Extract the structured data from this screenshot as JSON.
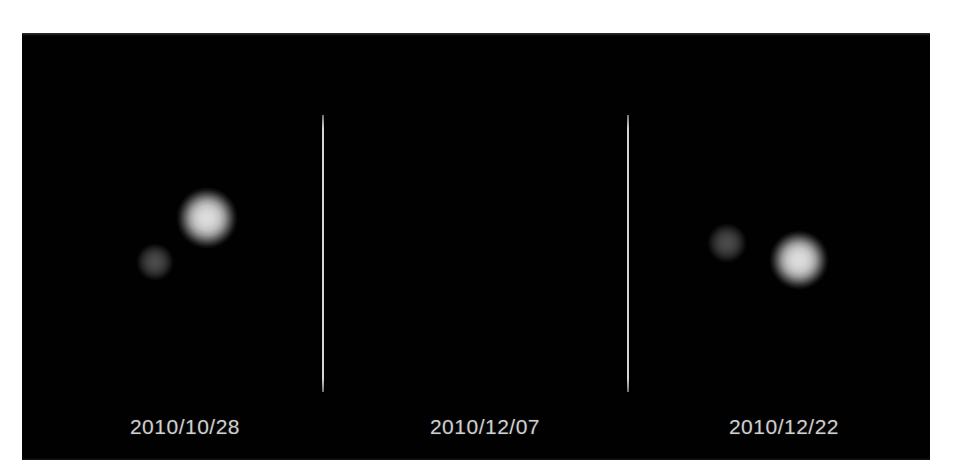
{
  "figure": {
    "background_color": "#ffffff",
    "plate_color": "#010101",
    "caption_color": "#cfcfcf",
    "divider_color": "#e1e1e1"
  },
  "panels": [
    {
      "id": "panel-1",
      "date": "2010/10/28",
      "objects": [
        {
          "name": "charon",
          "label": "dim companion",
          "brightness": "dim",
          "cx": 133,
          "cy": 229,
          "r": 19
        },
        {
          "name": "pluto",
          "label": "bright primary",
          "brightness": "bright",
          "cx": 185,
          "cy": 185,
          "r": 31
        }
      ]
    },
    {
      "id": "panel-2",
      "date": "2010/12/07",
      "objects": [
        {
          "name": "charon",
          "label": "dim companion",
          "brightness": "dim",
          "cx": 403,
          "cy": 210,
          "r": 20
        },
        {
          "name": "pluto",
          "label": "bright primary",
          "brightness": "bright",
          "cx": 475,
          "cy": 227,
          "r": 30
        }
      ]
    },
    {
      "id": "panel-3",
      "date": "2010/12/22",
      "objects": [
        {
          "name": "charon",
          "label": "dim companion",
          "brightness": "dim",
          "cx": 695,
          "cy": 203,
          "r": 19
        },
        {
          "name": "pluto",
          "label": "bright primary",
          "brightness": "bright",
          "cx": 756,
          "cy": 239,
          "r": 32
        }
      ]
    }
  ],
  "dividers": [
    {
      "id": "divider-1",
      "x": 300,
      "y_top": 82,
      "height": 277
    },
    {
      "id": "divider-2",
      "x": 605,
      "y_top": 82,
      "height": 277
    }
  ],
  "caption_layout": {
    "center_y": 382,
    "panel_1_center_x": 163,
    "panel_2_center_x": 463,
    "panel_3_center_x": 762
  }
}
